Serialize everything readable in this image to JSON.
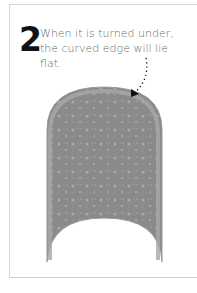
{
  "step": {
    "number": "2",
    "caption": "When it is turned under, the curved edge will lie flat."
  },
  "illustration": {
    "subject": "curved-fabric-panel",
    "fabric_color": "#8a8a8a",
    "edge_color": "#a5a5a5",
    "arrow_color": "#111111"
  },
  "icons": [
    "dotted-arrow-icon"
  ]
}
